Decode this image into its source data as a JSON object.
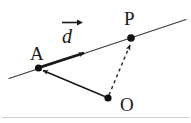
{
  "figure": {
    "title": "",
    "background_color": "#ffffff",
    "stroke_color": "#1a1a1a",
    "line_color": "#3a3a3a",
    "dash_color": "#4a4a4a",
    "baseline_color": "#cccccc",
    "labels": {
      "point_a": "A",
      "point_p": "P",
      "point_o": "O",
      "vector_d": "d"
    },
    "geometry": {
      "line_start": [
        10,
        78
      ],
      "line_end": [
        186,
        20
      ],
      "point_a": [
        38,
        68
      ],
      "point_p": [
        131,
        38
      ],
      "point_o": [
        108,
        98
      ],
      "vector_d_tip": [
        87,
        55
      ],
      "baseline_y": 117
    }
  }
}
